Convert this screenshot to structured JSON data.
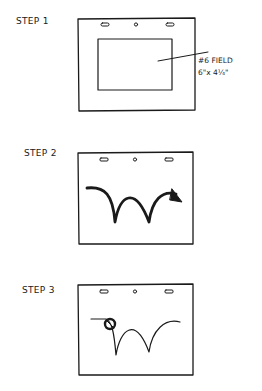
{
  "steps": [
    {
      "label": "STEP 1",
      "annotation": {
        "line1": "#6 FIELD",
        "line2": "6\"x 4¼\""
      }
    },
    {
      "label": "STEP 2"
    },
    {
      "label": "STEP 3"
    }
  ],
  "colors": {
    "ink": "#1a1a1a",
    "background": "#ffffff"
  }
}
